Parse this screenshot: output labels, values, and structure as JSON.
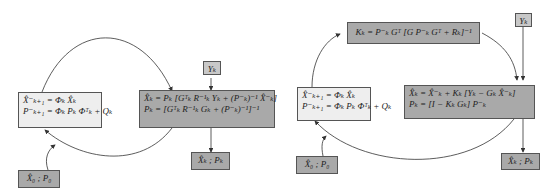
{
  "left_diagram": {
    "predict_box": {
      "line1": "X̂⁻ₖ₊₁ = Φₖ X̂ₖ",
      "line2": "P⁻ₖ₊₁ = Φₖ Pₖ Φᵀₖ + Qₖ"
    },
    "update_box": {
      "line1": "X̂ₖ = Pₖ [Gᵀₖ R⁻¹ₖ Yₖ + (P⁻ₖ)⁻¹ X̂⁻ₖ]",
      "line2": "Pₖ = [Gᵀₖ R⁻¹ₖ Gₖ + (P⁻ₖ)⁻¹]⁻¹"
    },
    "measurement_box": {
      "label": "Yₖ"
    },
    "output_box": {
      "label": "X̂ₖ ; Pₖ"
    },
    "init_box": {
      "label": "X̂₀ ; P₀"
    }
  },
  "right_diagram": {
    "gain_box": {
      "line1": "Kₖ = P⁻ₖ Gᵀ [G P⁻ₖ Gᵀ + Rₖ]⁻¹"
    },
    "predict_box": {
      "line1": "X̂⁻ₖ₊₁ = Φₖ X̂ₖ",
      "line2": "P⁻ₖ₊₁ = Φₖ Pₖ Φᵀₖ + Qₖ"
    },
    "update_box": {
      "line1": "X̂ₖ = X̂⁻ₖ + Kₖ [Yₖ − Gₖ X̂⁻ₖ]",
      "line2": "Pₖ = [I − Kₖ Gₖ] P⁻ₖ"
    },
    "measurement_box": {
      "label": "Yₖ"
    },
    "output_box": {
      "label": "X̂ₖ ; Pₖ"
    },
    "init_box": {
      "label": "X̂₀ ; P₀"
    }
  },
  "colors": {
    "dark_box": "#a9a9a9",
    "light_box": "#eeeeee",
    "border": "#555555",
    "arrow": "#333333"
  }
}
